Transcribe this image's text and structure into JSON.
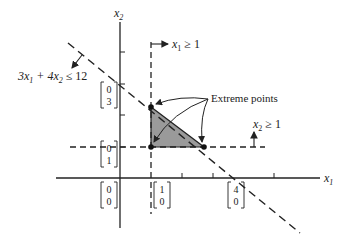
{
  "figure": {
    "axes": {
      "x_label": "x",
      "x_label_sub": "1",
      "y_label": "x",
      "y_label_sub": "2"
    },
    "constraints": [
      {
        "lhs_a": "3x",
        "lhs_a_sub": "1",
        "lhs_b": " + 4x",
        "lhs_b_sub": "2",
        "rel": " ≤ 12"
      },
      {
        "var": "x",
        "var_sub": "1",
        "rel": " ≥ 1"
      },
      {
        "var": "x",
        "var_sub": "2",
        "rel": " ≥ 1"
      }
    ],
    "annotation": "Extreme points",
    "vectors": [
      {
        "top": "0",
        "bottom": "3"
      },
      {
        "top": "0",
        "bottom": "1"
      },
      {
        "top": "0",
        "bottom": "0"
      },
      {
        "top": "1",
        "bottom": "0"
      },
      {
        "top": "4",
        "bottom": "0"
      }
    ],
    "extreme_points": [
      [
        1,
        2.25
      ],
      [
        1,
        1
      ],
      [
        2.67,
        1
      ]
    ],
    "colors": {
      "line": "#222222",
      "feasible_fill": "#9a9a9a"
    }
  }
}
